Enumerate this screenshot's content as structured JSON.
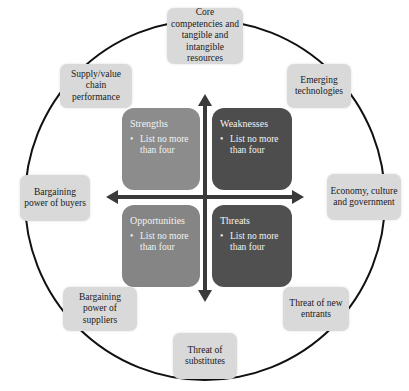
{
  "diagram": {
    "colors": {
      "ring": "#111111",
      "outer_box": "#d9d9d9",
      "strengths": "#8c8c8c",
      "weaknesses": "#4d4d4d",
      "opportunities": "#858585",
      "threats": "#505050",
      "arrow": "#3a3a3a"
    },
    "quadrants": [
      {
        "id": "strengths",
        "title": "Strengths",
        "bullet": "•",
        "item": "List no more than four"
      },
      {
        "id": "weaknesses",
        "title": "Weaknesses",
        "bullet": "•",
        "item": "List no more than four"
      },
      {
        "id": "opportunities",
        "title": "Opportunities",
        "bullet": "•",
        "item": "List no more than four"
      },
      {
        "id": "threats",
        "title": "Threats",
        "bullet": "•",
        "item": "List no more than four"
      }
    ],
    "outer_factors": [
      {
        "label": "Core competencies and tangible and intangible resources"
      },
      {
        "label": "Emerging technologies"
      },
      {
        "label": "Economy, culture and government"
      },
      {
        "label": "Threat of new entrants"
      },
      {
        "label": "Threat of substitutes"
      },
      {
        "label": "Bargaining power of suppliers"
      },
      {
        "label": "Bargaining power of buyers"
      },
      {
        "label": "Supply/value chain performance"
      }
    ]
  }
}
